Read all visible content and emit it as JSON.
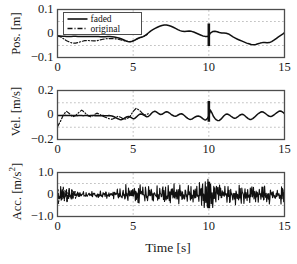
{
  "figure": {
    "xlabel": "Time [s]",
    "xticks": [
      "0",
      "5",
      "10",
      "15"
    ],
    "xtick_values": [
      0,
      5,
      10,
      15
    ],
    "xlim": [
      0,
      15
    ],
    "background": "#ffffff",
    "line_color": "#111111",
    "grid_color": "#7a7a7a",
    "axis_color": "#4d4d4d"
  },
  "legend": {
    "position": "top-left",
    "entries": [
      {
        "label": "faded",
        "style": "solid"
      },
      {
        "label": "original",
        "style": "dashdot"
      }
    ]
  },
  "chart_data": [
    {
      "type": "line",
      "title": "",
      "xlabel": "",
      "ylabel": "Pos. [m]",
      "ylabel_main": "Pos. [m]",
      "xlim": [
        0,
        15
      ],
      "ylim": [
        -0.1,
        0.1
      ],
      "yticks": [
        "0.1",
        "0",
        "-0.1"
      ],
      "ytick_values": [
        0.1,
        0,
        -0.1
      ],
      "grid": true,
      "grid_y": [
        -0.05,
        0.05
      ],
      "grid_x": [
        5,
        10
      ],
      "event_marker": {
        "x": 10,
        "y_low": -0.052,
        "y_high": 0.042
      },
      "series": [
        {
          "name": "faded",
          "style": "solid",
          "x": [
            0,
            0.15,
            0.3,
            0.45,
            0.6,
            0.75,
            0.9,
            1.05,
            1.2,
            1.35,
            1.5,
            1.65,
            1.8,
            1.95,
            2.1,
            2.25,
            2.4,
            2.55,
            2.7,
            2.85,
            3,
            3.15,
            3.3,
            3.45,
            3.6,
            3.75,
            3.9,
            4.05,
            4.2,
            4.35,
            4.5,
            4.65,
            4.8,
            4.95,
            5.1,
            5.25,
            5.4,
            5.55,
            5.7,
            5.85,
            6,
            6.15,
            6.3,
            6.45,
            6.6,
            6.75,
            6.9,
            7.05,
            7.2,
            7.35,
            7.5,
            7.65,
            7.8,
            7.95,
            8.1,
            8.25,
            8.4,
            8.55,
            8.7,
            8.85,
            9,
            9.15,
            9.3,
            9.45,
            9.6,
            9.75,
            9.9,
            10,
            10.1,
            10.25,
            10.4,
            10.55,
            10.7,
            10.85,
            11,
            11.15,
            11.3,
            11.45,
            11.6,
            11.75,
            11.9,
            12.05,
            12.2,
            12.35,
            12.5,
            12.65,
            12.8,
            12.95,
            13.1,
            13.25,
            13.4,
            13.55,
            13.7,
            13.85,
            14,
            14.15,
            14.3,
            14.45,
            14.6,
            14.75,
            14.9,
            15
          ],
          "y": [
            -0.01,
            -0.01,
            -0.011,
            -0.011,
            -0.012,
            -0.012,
            -0.012,
            -0.011,
            -0.011,
            -0.012,
            -0.012,
            -0.013,
            -0.013,
            -0.013,
            -0.012,
            -0.012,
            -0.012,
            -0.013,
            -0.013,
            -0.014,
            -0.014,
            -0.014,
            -0.013,
            -0.013,
            -0.014,
            -0.015,
            -0.017,
            -0.019,
            -0.022,
            -0.026,
            -0.03,
            -0.033,
            -0.034,
            -0.032,
            -0.028,
            -0.022,
            -0.018,
            -0.016,
            -0.012,
            -0.006,
            0.002,
            0.01,
            0.016,
            0.021,
            0.026,
            0.03,
            0.033,
            0.035,
            0.035,
            0.033,
            0.03,
            0.026,
            0.021,
            0.016,
            0.012,
            0.009,
            0.008,
            0.009,
            0.01,
            0.009,
            0.006,
            0.002,
            -0.002,
            -0.006,
            -0.01,
            -0.012,
            -0.013,
            -0.01,
            0.002,
            0.008,
            0.009,
            0.007,
            0.004,
            0.002,
            0.002,
            0.001,
            -0.002,
            -0.008,
            -0.014,
            -0.019,
            -0.024,
            -0.028,
            -0.032,
            -0.036,
            -0.04,
            -0.043,
            -0.046,
            -0.047,
            -0.046,
            -0.043,
            -0.04,
            -0.038,
            -0.038,
            -0.039,
            -0.038,
            -0.034,
            -0.028,
            -0.021,
            -0.014,
            -0.008,
            -0.002,
            0.004,
            0.012
          ]
        },
        {
          "name": "original",
          "style": "dashdot",
          "x": [
            0,
            0.2,
            0.4,
            0.6,
            0.8,
            1,
            1.2,
            1.4,
            1.6,
            1.8,
            2,
            2.2,
            2.4,
            2.6,
            2.8,
            3,
            3.2,
            3.4,
            3.6,
            3.8,
            4,
            4.2,
            4.4,
            4.6,
            4.8,
            5,
            5.2,
            5.4,
            5.6,
            5.8,
            6
          ],
          "y": [
            -0.009,
            -0.014,
            -0.022,
            -0.03,
            -0.036,
            -0.04,
            -0.04,
            -0.037,
            -0.033,
            -0.03,
            -0.029,
            -0.03,
            -0.031,
            -0.03,
            -0.027,
            -0.024,
            -0.022,
            -0.021,
            -0.021,
            -0.022,
            -0.024,
            -0.027,
            -0.03,
            -0.033,
            -0.034,
            -0.031,
            -0.025,
            -0.019,
            -0.014,
            -0.008,
            -0.002
          ]
        }
      ]
    },
    {
      "type": "line",
      "title": "",
      "xlabel": "",
      "ylabel": "Vel. [m/s]",
      "ylabel_main": "Vel. [m/s]",
      "xlim": [
        0,
        15
      ],
      "ylim": [
        -0.2,
        0.2
      ],
      "yticks": [
        "0.2",
        "0",
        "-0.2"
      ],
      "ytick_values": [
        0.2,
        0,
        -0.2
      ],
      "grid": true,
      "grid_y": [
        -0.1,
        0.1
      ],
      "grid_x": [
        5,
        10
      ],
      "event_marker": {
        "x": 10,
        "y_low": -0.055,
        "y_high": 0.115
      },
      "series": [
        {
          "name": "faded",
          "style": "solid",
          "x": [
            0,
            0.1,
            0.2,
            0.3,
            0.4,
            0.5,
            0.6,
            0.7,
            0.8,
            0.9,
            1,
            1.1,
            1.2,
            1.3,
            1.4,
            1.5,
            1.6,
            1.7,
            1.8,
            1.9,
            2,
            2.1,
            2.2,
            2.3,
            2.4,
            2.5,
            2.6,
            2.7,
            2.8,
            2.9,
            3,
            3.1,
            3.2,
            3.3,
            3.4,
            3.5,
            3.6,
            3.7,
            3.8,
            3.9,
            4,
            4.1,
            4.2,
            4.3,
            4.4,
            4.5,
            4.6,
            4.7,
            4.8,
            4.9,
            5,
            5.1,
            5.2,
            5.3,
            5.4,
            5.5,
            5.6,
            5.7,
            5.8,
            5.9,
            6,
            6.1,
            6.2,
            6.3,
            6.4,
            6.5,
            6.6,
            6.7,
            6.8,
            6.9,
            7,
            7.1,
            7.2,
            7.3,
            7.4,
            7.5,
            7.6,
            7.7,
            7.8,
            7.9,
            8,
            8.1,
            8.2,
            8.3,
            8.4,
            8.5,
            8.6,
            8.7,
            8.8,
            8.9,
            9,
            9.1,
            9.2,
            9.3,
            9.4,
            9.5,
            9.6,
            9.7,
            9.8,
            9.9,
            10,
            10.1,
            10.2,
            10.3,
            10.4,
            10.5,
            10.6,
            10.7,
            10.8,
            10.9,
            11,
            11.1,
            11.2,
            11.3,
            11.4,
            11.5,
            11.6,
            11.7,
            11.8,
            11.9,
            12,
            12.1,
            12.2,
            12.3,
            12.4,
            12.5,
            12.6,
            12.7,
            12.8,
            12.9,
            13,
            13.1,
            13.2,
            13.3,
            13.4,
            13.5,
            13.6,
            13.7,
            13.8,
            13.9,
            14,
            14.1,
            14.2,
            14.3,
            14.4,
            14.5,
            14.6,
            14.7,
            14.8,
            14.9,
            15
          ],
          "y": [
            -0.005,
            -0.004,
            -0.004,
            -0.005,
            -0.004,
            -0.003,
            -0.004,
            -0.005,
            -0.004,
            -0.004,
            -0.005,
            -0.004,
            -0.005,
            -0.006,
            -0.005,
            -0.004,
            -0.005,
            -0.006,
            -0.005,
            -0.004,
            -0.005,
            -0.006,
            -0.005,
            -0.004,
            -0.005,
            -0.006,
            -0.005,
            -0.006,
            -0.007,
            -0.006,
            -0.005,
            -0.006,
            -0.007,
            -0.006,
            -0.005,
            -0.006,
            -0.008,
            -0.012,
            -0.018,
            -0.025,
            -0.031,
            -0.036,
            -0.038,
            -0.035,
            -0.028,
            -0.02,
            -0.014,
            -0.012,
            -0.016,
            -0.024,
            -0.03,
            -0.028,
            -0.018,
            -0.006,
            0.004,
            0.008,
            0.006,
            0.0,
            -0.008,
            -0.014,
            -0.012,
            -0.002,
            0.012,
            0.024,
            0.03,
            0.028,
            0.02,
            0.01,
            0.004,
            0.006,
            0.014,
            0.022,
            0.026,
            0.024,
            0.016,
            0.006,
            -0.002,
            -0.008,
            -0.01,
            -0.006,
            0.002,
            0.008,
            0.01,
            0.004,
            -0.006,
            -0.018,
            -0.028,
            -0.034,
            -0.036,
            -0.032,
            -0.024,
            -0.016,
            -0.01,
            -0.008,
            -0.012,
            -0.02,
            -0.03,
            -0.038,
            -0.04,
            -0.03,
            -0.01,
            0.04,
            0.018,
            -0.01,
            -0.028,
            -0.04,
            -0.046,
            -0.044,
            -0.034,
            -0.02,
            -0.006,
            0.004,
            0.008,
            0.004,
            -0.004,
            -0.014,
            -0.022,
            -0.026,
            -0.024,
            -0.016,
            -0.006,
            0.002,
            0.006,
            0.002,
            -0.008,
            -0.02,
            -0.03,
            -0.036,
            -0.036,
            -0.03,
            -0.02,
            -0.008,
            0.004,
            0.014,
            0.022,
            0.026,
            0.024,
            0.016,
            0.006,
            -0.004,
            -0.01,
            -0.012,
            -0.008,
            0.0,
            0.01,
            0.02,
            0.028,
            0.032,
            0.03,
            0.022,
            0.01
          ]
        },
        {
          "name": "original",
          "style": "dashdot",
          "x": [
            0,
            0.2,
            0.4,
            0.6,
            0.8,
            1,
            1.2,
            1.4,
            1.6,
            1.8,
            2,
            2.2,
            2.4,
            2.6,
            2.8,
            3,
            3.2,
            3.4,
            3.6,
            3.8,
            4,
            4.2,
            4.4,
            4.6,
            4.8,
            5,
            5.2,
            5.4,
            5.6,
            5.8,
            6
          ],
          "y": [
            -0.095,
            -0.05,
            0.005,
            0.03,
            0.01,
            -0.015,
            -0.005,
            0.02,
            0.04,
            0.02,
            -0.005,
            -0.015,
            0.0,
            0.015,
            0.005,
            -0.01,
            -0.02,
            -0.03,
            -0.035,
            -0.025,
            -0.01,
            -0.02,
            -0.035,
            -0.03,
            -0.01,
            0.03,
            0.055,
            0.04,
            0.015,
            0.0,
            0.01
          ]
        }
      ]
    },
    {
      "type": "line",
      "title": "",
      "xlabel": "Time [s]",
      "ylabel": "Acc. [m/s^2]",
      "ylabel_main": "Acc. [m/s",
      "ylabel_sup": "2",
      "ylabel_tail": "]",
      "xlim": [
        0,
        15
      ],
      "ylim": [
        -1.0,
        1.0
      ],
      "yticks": [
        "1.0",
        "0",
        "-1.0"
      ],
      "ytick_values": [
        1.0,
        0,
        -1.0
      ],
      "grid": true,
      "grid_y": [
        -0.5,
        0.5
      ],
      "grid_x": [
        5,
        10
      ],
      "event_marker": {
        "x": 10,
        "y_low": -0.62,
        "y_high": 0.58
      },
      "series": [
        {
          "name": "faded",
          "style": "solid",
          "noise_envelope": [
            {
              "x": 0,
              "amp": 0.05
            },
            {
              "x": 0.3,
              "amp": 0.45
            },
            {
              "x": 1.2,
              "amp": 0.12
            },
            {
              "x": 2.0,
              "amp": 0.1
            },
            {
              "x": 3.0,
              "amp": 0.14
            },
            {
              "x": 4.0,
              "amp": 0.2
            },
            {
              "x": 5.0,
              "amp": 0.42
            },
            {
              "x": 6.0,
              "amp": 0.34
            },
            {
              "x": 7.5,
              "amp": 0.36
            },
            {
              "x": 9.0,
              "amp": 0.34
            },
            {
              "x": 10.0,
              "amp": 0.6
            },
            {
              "x": 11.0,
              "amp": 0.34
            },
            {
              "x": 13.0,
              "amp": 0.36
            },
            {
              "x": 14.5,
              "amp": 0.4
            },
            {
              "x": 15.0,
              "amp": 0.42
            }
          ]
        },
        {
          "name": "original",
          "style": "dashdot",
          "noise_envelope": [
            {
              "x": 0,
              "amp": 0.35
            },
            {
              "x": 0.6,
              "amp": 0.3
            },
            {
              "x": 1.2,
              "amp": 0.18
            },
            {
              "x": 1.6,
              "amp": 0.06
            }
          ]
        }
      ]
    }
  ]
}
